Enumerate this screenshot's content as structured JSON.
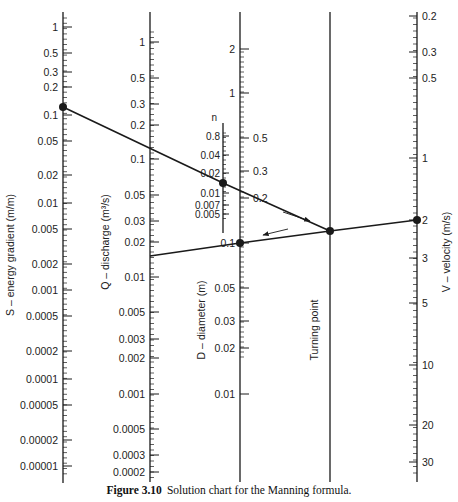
{
  "figure": {
    "caption_number": "Figure 3.10",
    "caption_text": "Solution chart for the Manning formula."
  },
  "axes": {
    "S": {
      "title": "S – energy gradient (m/m)",
      "x": 63,
      "y_top": 12,
      "y_bottom": 483,
      "label_side": "left",
      "ticks": [
        {
          "label": "1",
          "y": 27
        },
        {
          "label": "0.5",
          "y": 53
        },
        {
          "label": "0.3",
          "y": 72
        },
        {
          "label": "0.2",
          "y": 87
        },
        {
          "label": "0.1",
          "y": 115
        },
        {
          "label": "0.05",
          "y": 141
        },
        {
          "label": "0.02",
          "y": 175
        },
        {
          "label": "0.01",
          "y": 203
        },
        {
          "label": "0.005",
          "y": 229
        },
        {
          "label": "0.002",
          "y": 264
        },
        {
          "label": "0.001",
          "y": 290
        },
        {
          "label": "0.0005",
          "y": 316
        },
        {
          "label": "0.0002",
          "y": 351
        },
        {
          "label": "0.0001",
          "y": 379
        },
        {
          "label": "0.00005",
          "y": 405
        },
        {
          "label": "0.00002",
          "y": 440
        },
        {
          "label": "0.00001",
          "y": 466
        }
      ]
    },
    "Q": {
      "title": "Q – discharge (m³/s)",
      "x": 150,
      "y_top": 12,
      "y_bottom": 482,
      "label_side": "left",
      "ticks": [
        {
          "label": "1",
          "y": 42
        },
        {
          "label": "0.5",
          "y": 78
        },
        {
          "label": "0.3",
          "y": 104
        },
        {
          "label": "0.2",
          "y": 125
        },
        {
          "label": "0.1",
          "y": 159
        },
        {
          "label": "0.05",
          "y": 195
        },
        {
          "label": "0.03",
          "y": 221
        },
        {
          "label": "0.02",
          "y": 242
        },
        {
          "label": "0.01",
          "y": 277
        },
        {
          "label": "0.005",
          "y": 312
        },
        {
          "label": "0.003",
          "y": 339
        },
        {
          "label": "0.002",
          "y": 358
        },
        {
          "label": "0.001",
          "y": 394
        },
        {
          "label": "0.0005",
          "y": 429
        },
        {
          "label": "0.0003",
          "y": 455
        },
        {
          "label": "0.0002",
          "y": 472
        }
      ]
    },
    "n": {
      "title": "n",
      "x": 223,
      "y_top": 123,
      "y_bottom": 233,
      "label_side": "left",
      "ticks": [
        {
          "label": "0.8",
          "y": 136
        },
        {
          "label": "0.04",
          "y": 155
        },
        {
          "label": "0.02",
          "y": 173
        },
        {
          "label": "0.01",
          "y": 193
        },
        {
          "label": "0.007",
          "y": 205
        },
        {
          "label": "0.005",
          "y": 214
        }
      ]
    },
    "D": {
      "title": "D – diameter (m)",
      "x": 240,
      "y_top": 12,
      "y_bottom": 482,
      "ticks_upper_left": [
        {
          "label": "2",
          "y": 49
        },
        {
          "label": "1",
          "y": 93
        }
      ],
      "ticks_right": [
        {
          "label": "0.5",
          "y": 138
        },
        {
          "label": "0.3",
          "y": 171
        },
        {
          "label": "0.2",
          "y": 198
        }
      ],
      "ticks_lower_left": [
        {
          "label": "0.1",
          "y": 243
        },
        {
          "label": "0.05",
          "y": 288
        },
        {
          "label": "0.03",
          "y": 321
        },
        {
          "label": "0.02",
          "y": 348
        },
        {
          "label": "0.01",
          "y": 394
        }
      ]
    },
    "TP": {
      "title": "Turning point",
      "x": 330,
      "y_top": 12,
      "y_bottom": 482
    },
    "V": {
      "title": "V – velocity (m/s)",
      "x": 417,
      "y_top": 12,
      "y_bottom": 482,
      "label_side": "right",
      "ticks": [
        {
          "label": "0.2",
          "y": 16
        },
        {
          "label": "0.3",
          "y": 52
        },
        {
          "label": "0.5",
          "y": 78
        },
        {
          "label": "1",
          "y": 158
        },
        {
          "label": "2",
          "y": 220
        },
        {
          "label": "3",
          "y": 258
        },
        {
          "label": "5",
          "y": 303
        },
        {
          "label": "10",
          "y": 365
        },
        {
          "label": "20",
          "y": 425
        },
        {
          "label": "30",
          "y": 462
        }
      ]
    }
  },
  "solution_lines": [
    {
      "name": "S-to-turning-point",
      "points": [
        [
          63,
          107
        ],
        [
          223,
          183
        ],
        [
          330,
          231
        ]
      ]
    },
    {
      "name": "Q-to-V",
      "points": [
        [
          150,
          256
        ],
        [
          240,
          243
        ],
        [
          330,
          231
        ],
        [
          417,
          220
        ]
      ]
    }
  ],
  "points": [
    {
      "name": "S-point",
      "x": 63,
      "y": 107
    },
    {
      "name": "n-point",
      "x": 223,
      "y": 183
    },
    {
      "name": "D-point",
      "x": 240,
      "y": 243
    },
    {
      "name": "turning-point",
      "x": 330,
      "y": 231
    },
    {
      "name": "V-point",
      "x": 417,
      "y": 220
    }
  ],
  "arrows": [
    {
      "name": "arrow-toward-turning-point",
      "from": [
        283,
        212
      ],
      "to": [
        310,
        221
      ]
    },
    {
      "name": "arrow-toward-D",
      "from": [
        288,
        229
      ],
      "to": [
        263,
        235
      ]
    }
  ],
  "colors": {
    "ink": "#1a1a1a",
    "background": "#ffffff"
  }
}
